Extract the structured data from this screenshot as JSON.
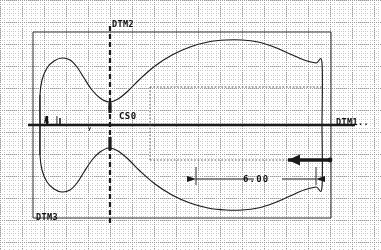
{
  "drawing": {
    "kind": "engineering-cad-profile-view",
    "background_color": "#fdfdfd",
    "line_color": "#1a1a1a",
    "grid_major_color": "#9a9a9a",
    "grid_minor_color": "#c8c8c8",
    "canvas": {
      "width": 381,
      "height": 250
    }
  },
  "grid": {
    "major_spacing": 22,
    "minor_spacing": 4.4,
    "style": "dotted"
  },
  "labels": {
    "datum_top": "DTM2",
    "datum_right": "DTM1..",
    "datum_bottom_left": "DTM3",
    "coordinate_system": "CS0",
    "axis_x": "x",
    "axis_y": "y",
    "left_marker": "A_|"
  },
  "dimensions": [
    {
      "name": "length-dimension",
      "value": "6.00",
      "arrow_style": "double-ended",
      "x_start": 196,
      "x_end": 316,
      "y": 179
    }
  ],
  "annotations": [
    {
      "name": "bold-leader-arrow",
      "direction": "left",
      "x_start": 330,
      "x_end": 288,
      "y": 160
    }
  ],
  "bounding_box": {
    "x": 33,
    "y": 32,
    "width": 298,
    "height": 186
  },
  "chart_data": {
    "type": "line",
    "title": "",
    "xlabel": "",
    "ylabel": "",
    "grid": true,
    "legend": null,
    "xlim": [
      33,
      331
    ],
    "ylim": [
      32,
      218
    ],
    "series": [
      {
        "name": "upper-profile",
        "comment": "upper surface of symmetric profile, x,y in px",
        "points": [
          [
            40,
            125
          ],
          [
            40,
            95
          ],
          [
            42,
            80
          ],
          [
            47,
            68
          ],
          [
            54,
            61
          ],
          [
            62,
            58
          ],
          [
            70,
            60
          ],
          [
            77,
            67
          ],
          [
            84,
            78
          ],
          [
            92,
            90
          ],
          [
            100,
            98
          ],
          [
            109,
            102
          ],
          [
            118,
            99
          ],
          [
            128,
            91
          ],
          [
            140,
            79
          ],
          [
            155,
            66
          ],
          [
            172,
            55
          ],
          [
            190,
            47
          ],
          [
            208,
            42
          ],
          [
            226,
            40
          ],
          [
            242,
            40
          ],
          [
            258,
            42
          ],
          [
            274,
            47
          ],
          [
            290,
            54
          ],
          [
            304,
            60
          ],
          [
            316,
            63
          ],
          [
            322,
            63
          ],
          [
            322,
            125
          ]
        ]
      },
      {
        "name": "lower-profile",
        "comment": "lower surface, mirror of upper about y=125",
        "points": [
          [
            40,
            125
          ],
          [
            40,
            155
          ],
          [
            42,
            170
          ],
          [
            47,
            182
          ],
          [
            54,
            189
          ],
          [
            62,
            192
          ],
          [
            70,
            190
          ],
          [
            77,
            183
          ],
          [
            84,
            172
          ],
          [
            92,
            160
          ],
          [
            100,
            152
          ],
          [
            109,
            148
          ],
          [
            118,
            151
          ],
          [
            128,
            159
          ],
          [
            140,
            171
          ],
          [
            155,
            184
          ],
          [
            172,
            195
          ],
          [
            190,
            203
          ],
          [
            208,
            208
          ],
          [
            226,
            210
          ],
          [
            242,
            210
          ],
          [
            258,
            208
          ],
          [
            274,
            203
          ],
          [
            290,
            196
          ],
          [
            304,
            190
          ],
          [
            316,
            187
          ],
          [
            322,
            187
          ],
          [
            322,
            125
          ]
        ]
      }
    ],
    "reference_lines": [
      {
        "name": "horizontal-axis",
        "orientation": "h",
        "pos": 125,
        "from": 28,
        "to": 355,
        "weight": "bold"
      },
      {
        "name": "datum-2-vertical",
        "orientation": "v",
        "pos": 110,
        "from": 26,
        "to": 224,
        "weight": "bold-dashed"
      },
      {
        "name": "datum-3-bottom",
        "orientation": "h",
        "pos": 218,
        "from": 33,
        "to": 331,
        "weight": "thin"
      },
      {
        "name": "datum-top-edge",
        "orientation": "h",
        "pos": 32,
        "from": 33,
        "to": 331,
        "weight": "thin"
      },
      {
        "name": "frame-left",
        "orientation": "v",
        "pos": 33,
        "from": 32,
        "to": 218,
        "weight": "thin"
      },
      {
        "name": "frame-right",
        "orientation": "v",
        "pos": 331,
        "from": 32,
        "to": 218,
        "weight": "thin"
      },
      {
        "name": "witness-upper",
        "orientation": "h",
        "pos": 87,
        "from": 150,
        "to": 322,
        "weight": "dotted"
      },
      {
        "name": "witness-lower",
        "orientation": "h",
        "pos": 160,
        "from": 150,
        "to": 322,
        "weight": "dotted"
      },
      {
        "name": "witness-vertical",
        "orientation": "v",
        "pos": 150,
        "from": 87,
        "to": 160,
        "weight": "dotted"
      }
    ]
  }
}
